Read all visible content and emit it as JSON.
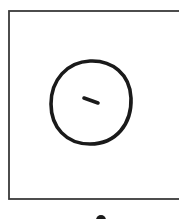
{
  "diagram": {
    "stroke_color": "#1a1a1a",
    "frame_color": "#3a3a3a",
    "background": "#ffffff",
    "shapes": {
      "frame": {
        "type": "rectangle",
        "x": 9,
        "y": 11,
        "width": 175,
        "height": 188
      },
      "circle": {
        "type": "ellipse",
        "cx": 91,
        "cy": 102,
        "rx": 40,
        "ry": 42
      },
      "dash": {
        "type": "line",
        "x1": 84,
        "y1": 98,
        "x2": 98,
        "y2": 103
      },
      "dot": {
        "type": "dot",
        "cx": 101,
        "cy": 219,
        "r": 5
      }
    }
  }
}
